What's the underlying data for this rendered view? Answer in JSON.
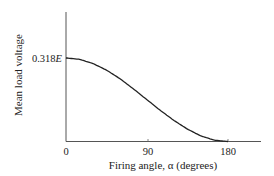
{
  "chart_data": {
    "type": "line",
    "title": "",
    "xlabel": "Firing angle, α (degrees)",
    "ylabel": "Mean load voltage",
    "x_ticks": [
      "0",
      "90",
      "180"
    ],
    "y_ticks": [
      "0.318E"
    ],
    "xlim": [
      0,
      200
    ],
    "ylim": [
      0,
      0.4
    ],
    "grid": false,
    "legend": null,
    "series": [
      {
        "name": "Mean load voltage (×E)",
        "x": [
          0,
          15,
          30,
          45,
          60,
          75,
          90,
          105,
          120,
          135,
          150,
          165,
          180
        ],
        "values": [
          0.318,
          0.313,
          0.297,
          0.272,
          0.239,
          0.2,
          0.159,
          0.118,
          0.08,
          0.047,
          0.021,
          0.005,
          0.0
        ]
      }
    ]
  },
  "labels": {
    "ylabel": "Mean load voltage",
    "xlabel": "Firing angle, α (degrees)",
    "ytick_value": "0.318",
    "ytick_var": "E",
    "xtick_0": "0",
    "xtick_90": "90",
    "xtick_180": "180"
  },
  "colors": {
    "axis": "#555555",
    "curve": "#222222",
    "text": "#222222"
  }
}
